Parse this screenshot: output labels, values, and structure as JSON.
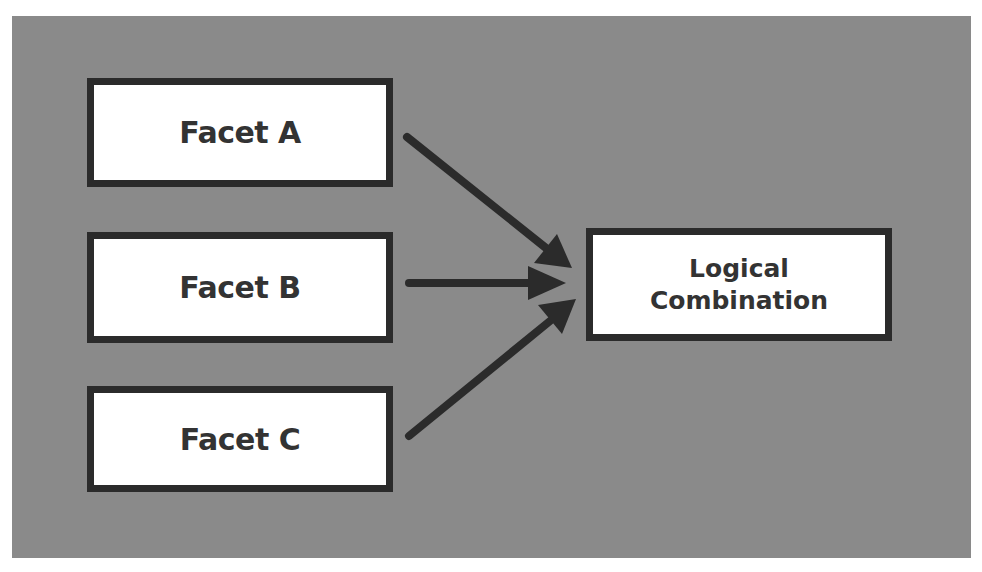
{
  "diagram": {
    "type": "flow",
    "inputs": [
      {
        "id": "facet-a",
        "label": "Facet A"
      },
      {
        "id": "facet-b",
        "label": "Facet B"
      },
      {
        "id": "facet-c",
        "label": "Facet C"
      }
    ],
    "output": {
      "id": "logical-combination",
      "label_line1": "Logical",
      "label_line2": "Combination"
    },
    "edges": [
      {
        "from": "facet-a",
        "to": "logical-combination"
      },
      {
        "from": "facet-b",
        "to": "logical-combination"
      },
      {
        "from": "facet-c",
        "to": "logical-combination"
      }
    ],
    "colors": {
      "background": "#8a8a8a",
      "box_fill": "#ffffff",
      "box_border": "#2b2b2b",
      "arrow": "#2b2b2b",
      "text": "#333333"
    }
  }
}
